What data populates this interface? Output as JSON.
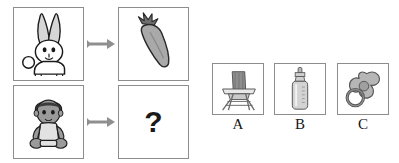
{
  "puzzle": {
    "type": "visual-analogy",
    "prompt_symbol": "?",
    "rows": [
      {
        "id": "row-example",
        "left": {
          "icon": "rabbit-icon",
          "label": "rabbit"
        },
        "relation": "arrow-right-icon",
        "right": {
          "icon": "carrot-icon",
          "label": "carrot"
        }
      },
      {
        "id": "row-question",
        "left": {
          "icon": "baby-icon",
          "label": "baby"
        },
        "relation": "arrow-right-icon",
        "right": {
          "icon": "question-mark-icon",
          "label": "?"
        }
      }
    ]
  },
  "options": [
    {
      "id": "option-a",
      "label": "A",
      "icon": "high-chair-icon",
      "name": "high chair"
    },
    {
      "id": "option-b",
      "label": "B",
      "icon": "baby-bottle-icon",
      "name": "baby bottle"
    },
    {
      "id": "option-c",
      "label": "C",
      "icon": "pacifier-icon",
      "name": "pacifier"
    }
  ],
  "colors": {
    "page_background": "#ffffff",
    "cell_border": "#8d8d8d",
    "ink": "#1a1a1a",
    "arrow": "#8f8f8f",
    "fill_light": "#dcdcdc",
    "fill_mid": "#b0b0b0",
    "fill_dark": "#6f6f6f",
    "fill_darkest": "#3a3a3a"
  }
}
